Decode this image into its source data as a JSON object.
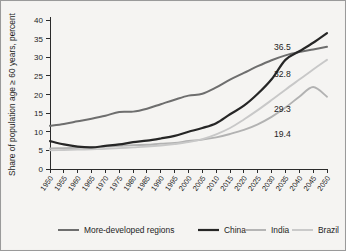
{
  "chart_data": {
    "type": "line",
    "title": "",
    "subtitle": "",
    "xlabel": "",
    "ylabel": "Share of population age ≥ 60 years, percent",
    "grid": false,
    "legend_position": "bottom",
    "xlim": [
      1950,
      2050
    ],
    "ylim": [
      0,
      40
    ],
    "ytick_values": [
      0,
      5,
      10,
      15,
      20,
      25,
      30,
      35,
      40
    ],
    "ytick_labels": [
      "0",
      "5",
      "10",
      "15",
      "20",
      "25",
      "30",
      "35",
      "40"
    ],
    "categories": [
      1950,
      1955,
      1960,
      1965,
      1970,
      1975,
      1980,
      1985,
      1990,
      1995,
      2000,
      2005,
      2010,
      2015,
      2020,
      2025,
      2030,
      2035,
      2040,
      2045,
      2050
    ],
    "xtick_labels": [
      "1950",
      "1955",
      "1960",
      "1965",
      "1970",
      "1975",
      "1980",
      "1985",
      "1990",
      "1995",
      "2000",
      "2005",
      "2010",
      "2015",
      "2020",
      "2025",
      "2030",
      "2035",
      "2040",
      "2045",
      "2050"
    ],
    "series": [
      {
        "name": "More-developed regions",
        "color": "#6e6e6e",
        "width": 2.0,
        "end_label": "36.5",
        "values": [
          11.6,
          12.1,
          12.8,
          13.5,
          14.3,
          15.3,
          15.4,
          16.2,
          17.4,
          18.6,
          19.7,
          20.2,
          21.9,
          24.0,
          25.8,
          27.6,
          29.2,
          30.5,
          31.4,
          32.1,
          32.8
        ]
      },
      {
        "name": "China",
        "color": "#262626",
        "width": 2.2,
        "end_label": "32.8",
        "values": [
          7.5,
          6.6,
          6.0,
          5.8,
          6.2,
          6.6,
          7.2,
          7.6,
          8.2,
          8.9,
          10.0,
          11.0,
          12.3,
          14.7,
          17.0,
          20.2,
          24.1,
          29.3,
          31.6,
          33.9,
          36.5
        ]
      },
      {
        "name": "India",
        "color": "#b2b2b2",
        "width": 1.9,
        "end_label": "29.3",
        "values": [
          5.5,
          5.6,
          5.7,
          5.8,
          6.0,
          6.2,
          6.4,
          6.5,
          6.8,
          7.0,
          7.5,
          7.9,
          8.5,
          9.4,
          10.5,
          12.0,
          14.0,
          16.5,
          19.4,
          22.0,
          19.4
        ]
      },
      {
        "name": "Brazil",
        "color": "#c8c8c8",
        "width": 1.9,
        "end_label": "19.4",
        "values": [
          5.0,
          5.1,
          5.2,
          5.3,
          5.4,
          5.6,
          5.8,
          6.0,
          6.3,
          6.7,
          7.2,
          8.0,
          9.3,
          11.0,
          13.3,
          15.8,
          18.5,
          21.3,
          24.0,
          26.7,
          29.3
        ]
      }
    ],
    "annotations": [
      {
        "label": "36.5",
        "x_px": 272,
        "y_px": 48
      },
      {
        "label": "32.8",
        "x_px": 272,
        "y_px": 75
      },
      {
        "label": "29.3",
        "x_px": 272,
        "y_px": 110
      },
      {
        "label": "19.4",
        "x_px": 272,
        "y_px": 135
      }
    ],
    "legend": [
      {
        "label": "More-developed regions",
        "color": "#6e6e6e"
      },
      {
        "label": "China",
        "color": "#262626"
      },
      {
        "label": "India",
        "color": "#b2b2b2"
      },
      {
        "label": "Brazil",
        "color": "#c8c8c8"
      }
    ]
  }
}
